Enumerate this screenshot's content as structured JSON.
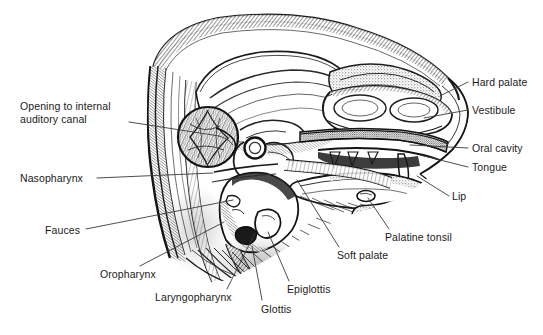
{
  "figure": {
    "type": "anatomical-illustration",
    "style": "black-and-white stippled line drawing",
    "background_color": "#ffffff",
    "ink_color": "#1a1a1a",
    "leader_line_color": "#3a3a3a"
  },
  "labels": [
    {
      "id": "opening-to-internal-auditory-canal",
      "text": "Opening to internal\nauditory canal",
      "side": "left",
      "x": 20,
      "y": 100,
      "leader": {
        "x1": 129,
        "y1": 122,
        "x2": 219,
        "y2": 136
      }
    },
    {
      "id": "nasopharynx",
      "text": "Nasopharynx",
      "side": "left",
      "x": 20,
      "y": 172,
      "leader": {
        "x1": 97,
        "y1": 178,
        "x2": 213,
        "y2": 173
      }
    },
    {
      "id": "fauces",
      "text": "Fauces",
      "side": "left",
      "x": 45,
      "y": 224,
      "leader": {
        "x1": 86,
        "y1": 229,
        "x2": 233,
        "y2": 200
      }
    },
    {
      "id": "oropharynx",
      "text": "Oropharynx",
      "side": "bottom",
      "x": 100,
      "y": 268,
      "leader": {
        "x1": 140,
        "y1": 266,
        "x2": 224,
        "y2": 222
      }
    },
    {
      "id": "laryngopharynx",
      "text": "Laryngopharynx",
      "side": "bottom",
      "x": 155,
      "y": 291,
      "leader": {
        "x1": 227,
        "y1": 289,
        "x2": 255,
        "y2": 233
      }
    },
    {
      "id": "glottis",
      "text": "Glottis",
      "side": "bottom",
      "x": 261,
      "y": 303,
      "leader": {
        "x1": 262,
        "y1": 300,
        "x2": 252,
        "y2": 246
      }
    },
    {
      "id": "epiglottis",
      "text": "Epiglottis",
      "side": "bottom",
      "x": 287,
      "y": 283,
      "leader": {
        "x1": 289,
        "y1": 281,
        "x2": 268,
        "y2": 232
      }
    },
    {
      "id": "soft-palate",
      "text": "Soft palate",
      "side": "bottom",
      "x": 337,
      "y": 249,
      "leader": {
        "x1": 339,
        "y1": 247,
        "x2": 297,
        "y2": 180
      }
    },
    {
      "id": "palatine-tonsil",
      "text": "Palatine tonsil",
      "side": "right",
      "x": 385,
      "y": 231,
      "leader": {
        "x1": 389,
        "y1": 229,
        "x2": 368,
        "y2": 198
      }
    },
    {
      "id": "hard-palate",
      "text": "Hard palate",
      "side": "right",
      "x": 472,
      "y": 76,
      "leader": {
        "x1": 468,
        "y1": 82,
        "x2": 440,
        "y2": 96
      }
    },
    {
      "id": "vestibule",
      "text": "Vestibule",
      "side": "right",
      "x": 472,
      "y": 104,
      "leader": {
        "x1": 468,
        "y1": 110,
        "x2": 424,
        "y2": 118
      }
    },
    {
      "id": "oral-cavity",
      "text": "Oral cavity",
      "side": "right",
      "x": 472,
      "y": 142,
      "leader": {
        "x1": 468,
        "y1": 148,
        "x2": 410,
        "y2": 145
      }
    },
    {
      "id": "tongue",
      "text": "Tongue",
      "side": "right",
      "x": 472,
      "y": 161,
      "leader": {
        "x1": 468,
        "y1": 167,
        "x2": 420,
        "y2": 155
      }
    },
    {
      "id": "lip",
      "text": "Lip",
      "side": "right",
      "x": 452,
      "y": 190,
      "leader": {
        "x1": 449,
        "y1": 196,
        "x2": 417,
        "y2": 176
      }
    }
  ]
}
